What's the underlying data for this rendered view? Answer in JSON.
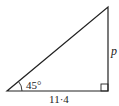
{
  "diagram": {
    "type": "right-triangle",
    "vertices": {
      "bottom_left": [
        7,
        91
      ],
      "bottom_right": [
        108,
        91
      ],
      "top_right": [
        108,
        7
      ]
    },
    "angle_label": "45°",
    "base_label": "11·4",
    "side_label": "p",
    "right_angle_marker": true,
    "colors": {
      "stroke": "#222222",
      "background": "#ffffff"
    }
  }
}
